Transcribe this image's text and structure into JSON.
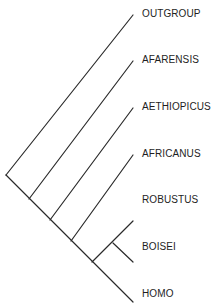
{
  "diagram": {
    "type": "cladogram",
    "root": [
      6,
      175
    ],
    "taxa": [
      {
        "name": "OUTGROUP",
        "tip": [
          133,
          15
        ],
        "label_pos": [
          142,
          8
        ]
      },
      {
        "name": "AFARENSIS",
        "tip": [
          133,
          61
        ],
        "label_pos": [
          142,
          54
        ]
      },
      {
        "name": "AETHIOPICUS",
        "tip": [
          133,
          108
        ],
        "label_pos": [
          142,
          101
        ]
      },
      {
        "name": "AFRICANUS",
        "tip": [
          133,
          155
        ],
        "label_pos": [
          142,
          148
        ]
      },
      {
        "name": "ROBUSTUS",
        "tip": [
          133,
          221
        ],
        "label_pos": [
          142,
          194
        ]
      },
      {
        "name": "BOISEI",
        "tip": [
          133,
          262
        ],
        "label_pos": [
          142,
          241
        ]
      },
      {
        "name": "HOMO",
        "tip": [
          133,
          302
        ],
        "label_pos": [
          142,
          288
        ]
      }
    ],
    "branches": [
      {
        "from": [
          6,
          175
        ],
        "to": [
          133,
          15
        ],
        "leads_to": "OUTGROUP"
      },
      {
        "from": [
          6,
          175
        ],
        "to": [
          133,
          302
        ],
        "leads_to": "trunk-to-HOMO"
      },
      {
        "from": [
          29,
          199
        ],
        "to": [
          133,
          61
        ],
        "leads_to": "AFARENSIS"
      },
      {
        "from": [
          50,
          220
        ],
        "to": [
          133,
          108
        ],
        "leads_to": "AETHIOPICUS"
      },
      {
        "from": [
          71,
          241
        ],
        "to": [
          133,
          155
        ],
        "leads_to": "AFRICANUS"
      },
      {
        "from": [
          92,
          262
        ],
        "to": [
          133,
          221
        ],
        "leads_to": "ROBUSTUS"
      },
      {
        "from": [
          113,
          243
        ],
        "to": [
          133,
          262
        ],
        "leads_to": "BOISEI"
      }
    ],
    "line_color": "#2a2a2a",
    "text_color": "#1e1e1e"
  }
}
